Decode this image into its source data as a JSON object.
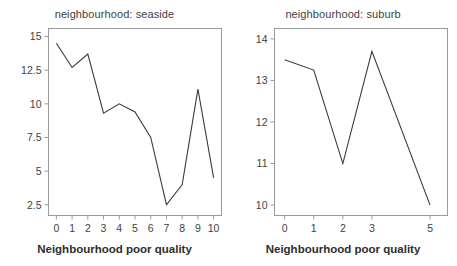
{
  "figure": {
    "background": "#ffffff",
    "line_color": "#3b3b3b",
    "axis_color": "#9a9a9a",
    "text_color": "#3f3f3f"
  },
  "panels": [
    {
      "id": "seaside",
      "title": "neighbourhood: seaside",
      "xlabel": "Neighbourhood poor quality",
      "xticks": [
        "0",
        "1",
        "2",
        "3",
        "4",
        "5",
        "6",
        "7",
        "8",
        "9",
        "10"
      ],
      "yticks": [
        "2.5",
        "5",
        "7.5",
        "10",
        "12.5",
        "15"
      ]
    },
    {
      "id": "suburb",
      "title": "neighbourhood: suburb",
      "xlabel": "Neighbourhood poor quality",
      "xticks": [
        "0",
        "1",
        "2",
        "3",
        "5"
      ],
      "yticks": [
        "10",
        "11",
        "12",
        "13",
        "14"
      ]
    }
  ],
  "chart_data": [
    {
      "type": "line",
      "title": "neighbourhood: seaside",
      "xlabel": "Neighbourhood poor quality",
      "ylabel": "",
      "x": [
        0,
        1,
        2,
        3,
        4,
        5,
        6,
        7,
        8,
        9,
        10
      ],
      "values": [
        14.5,
        12.7,
        13.7,
        9.3,
        10.0,
        9.4,
        7.5,
        2.5,
        4.0,
        11.1,
        4.5
      ],
      "xtick_labels": [
        "0",
        "1",
        "2",
        "3",
        "4",
        "5",
        "6",
        "7",
        "8",
        "9",
        "10"
      ],
      "ytick_labels": [
        "2.5",
        "5",
        "7.5",
        "10",
        "12.5",
        "15"
      ],
      "ytick_values": [
        2.5,
        5,
        7.5,
        10,
        12.5,
        15
      ],
      "xlim": [
        -0.5,
        10.5
      ],
      "ylim": [
        1.7,
        15.6
      ],
      "grid": false,
      "legend": "none"
    },
    {
      "type": "line",
      "title": "neighbourhood: suburb",
      "xlabel": "Neighbourhood poor quality",
      "ylabel": "",
      "x": [
        0,
        1,
        2,
        3,
        5
      ],
      "values": [
        13.5,
        13.25,
        11.0,
        13.7,
        10.0
      ],
      "xtick_labels": [
        "0",
        "1",
        "2",
        "3",
        "5"
      ],
      "ytick_labels": [
        "10",
        "11",
        "12",
        "13",
        "14"
      ],
      "ytick_values": [
        10,
        11,
        12,
        13,
        14
      ],
      "xlim": [
        -0.35,
        5.6
      ],
      "ylim": [
        9.75,
        14.25
      ],
      "grid": false,
      "legend": "none"
    }
  ]
}
